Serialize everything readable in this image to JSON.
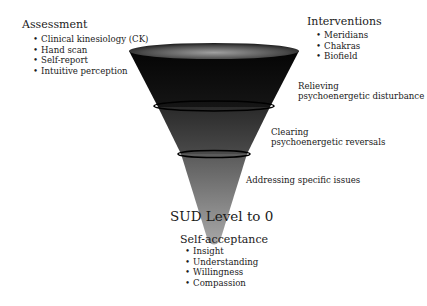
{
  "assessment": {
    "title": "Assessment",
    "items": [
      "Clinical kinesiology (CK)",
      "Hand scan",
      "Self-report",
      "Intuitive perception"
    ]
  },
  "interventions": {
    "title": "Interventions",
    "items": [
      "Meridians",
      "Chakras",
      "Biofield"
    ]
  },
  "funnel": {
    "stages": [
      {
        "line1": "Relieving",
        "line2": "psychoenergetic disturbance"
      },
      {
        "line1": "Clearing",
        "line2": "psychoenergetic reversals"
      },
      {
        "line1": "Addressing specific issues"
      }
    ],
    "colors": {
      "top": "#0a0a0a",
      "middle": "#3a3a3a",
      "bottom": "#9a9a9a",
      "rim": "#6e6e6e"
    }
  },
  "outcome": {
    "title": "SUD Level to 0"
  },
  "self_acceptance": {
    "title": "Self-acceptance",
    "items": [
      "Insight",
      "Understanding",
      "Willingness",
      "Compassion"
    ]
  }
}
